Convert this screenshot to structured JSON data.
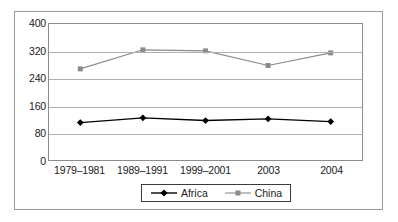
{
  "chart_data": {
    "type": "line",
    "title": "",
    "xlabel": "",
    "ylabel": "",
    "categories": [
      "1979–1981",
      "1989–1991",
      "1999–2001",
      "2003",
      "2004"
    ],
    "series": [
      {
        "name": "Africa",
        "values": [
          110,
          124,
          116,
          121,
          113
        ],
        "color": "#000000",
        "marker": "diamond"
      },
      {
        "name": "China",
        "values": [
          268,
          324,
          321,
          278,
          315
        ],
        "color": "#8a8a8a",
        "marker": "square"
      }
    ],
    "ylim": [
      0,
      400
    ],
    "yticks": [
      0,
      80,
      160,
      240,
      320,
      400
    ],
    "ytick_labels": [
      "0",
      "80",
      "160",
      "240",
      "320",
      "400"
    ],
    "grid": true,
    "legend_position": "bottom"
  },
  "legend": {
    "entries": [
      {
        "label": "Africa",
        "marker": "diamond-marker-icon"
      },
      {
        "label": "China",
        "marker": "square-marker-icon"
      }
    ]
  },
  "colors": {
    "africa_series": "#000000",
    "china_series": "#8a8a8a",
    "gridline": "#b0b0b0",
    "axis": "#8c8c8c",
    "outer_border": "#9a9a9a",
    "text": "#1a1a1a",
    "background": "#ffffff"
  }
}
